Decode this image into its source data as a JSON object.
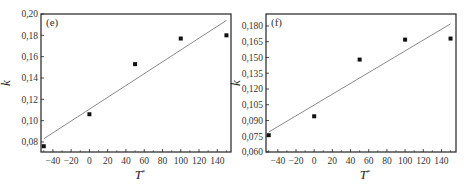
{
  "chart_data": [
    {
      "type": "scatter",
      "panel_label": "(e)",
      "xlabel": "T*",
      "ylabel": "k",
      "xlim": [
        -53,
        155
      ],
      "ylim": [
        0.0706,
        0.2
      ],
      "x_ticks": [
        -40,
        -20,
        0,
        20,
        40,
        60,
        80,
        100,
        120,
        140
      ],
      "x_tick_labels": [
        "-40",
        "-20",
        "0",
        "20",
        "40",
        "60",
        "80",
        "100",
        "120",
        "140"
      ],
      "y_ticks": [
        0.08,
        0.1,
        0.12,
        0.14,
        0.16,
        0.18,
        0.2
      ],
      "y_tick_labels": [
        "0,08",
        "0,10",
        "0,12",
        "0,14",
        "0,16",
        "0,18",
        "0,20"
      ],
      "grid": false,
      "series": [
        {
          "name": "data",
          "style": "square-marker",
          "x": [
            -50,
            0,
            50,
            100,
            150
          ],
          "y": [
            0.076,
            0.106,
            0.153,
            0.177,
            0.18
          ]
        },
        {
          "name": "linear fit",
          "style": "line",
          "x": [
            -50,
            150
          ],
          "y": [
            0.083,
            0.194
          ]
        }
      ],
      "frame": {
        "left": 41,
        "top": 14,
        "right": 231,
        "bottom": 152
      }
    },
    {
      "type": "scatter",
      "panel_label": "(f)",
      "xlabel": "T*",
      "ylabel": "k",
      "xlim": [
        -53,
        156
      ],
      "ylim": [
        0.06,
        0.1914
      ],
      "x_ticks": [
        -40,
        -20,
        0,
        20,
        40,
        60,
        80,
        100,
        120,
        140
      ],
      "x_tick_labels": [
        "-40",
        "-20",
        "0",
        "20",
        "40",
        "60",
        "80",
        "100",
        "120",
        "140"
      ],
      "y_ticks": [
        0.06,
        0.075,
        0.09,
        0.105,
        0.12,
        0.135,
        0.15,
        0.165,
        0.18
      ],
      "y_tick_labels": [
        "0,060",
        "0,075",
        "0,090",
        "0,105",
        "0,120",
        "0,135",
        "0,150",
        "0,165",
        "0,180"
      ],
      "grid": false,
      "series": [
        {
          "name": "data",
          "style": "square-marker",
          "x": [
            -50,
            0,
            50,
            100,
            150
          ],
          "y": [
            0.076,
            0.094,
            0.148,
            0.167,
            0.168
          ]
        },
        {
          "name": "linear fit",
          "style": "line",
          "x": [
            -50,
            150
          ],
          "y": [
            0.079,
            0.182
          ]
        }
      ],
      "frame": {
        "left": 266,
        "top": 14,
        "right": 456,
        "bottom": 152
      }
    }
  ],
  "colors": {
    "marker": "#111111",
    "fit_line": "#8a8a8a",
    "frame": "#222222"
  }
}
